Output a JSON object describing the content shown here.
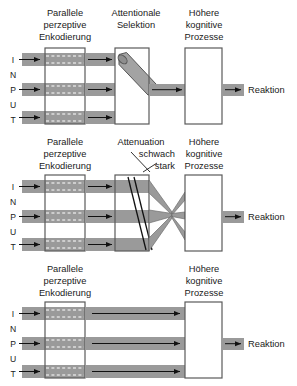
{
  "figure": {
    "colors": {
      "band": "#9a9a9a",
      "band_stroke": "#6e6e6e",
      "box_fill": "#ffffff",
      "box_stroke": "#5a5a5a",
      "arrow": "#111111",
      "text": "#1a1a1a",
      "dash": "#ffffff"
    }
  },
  "input_label": {
    "letters": [
      "I",
      "N",
      "P",
      "U",
      "T"
    ]
  },
  "panels": [
    {
      "id": "panel-early-selection",
      "headings": {
        "encoding": [
          "Parallele",
          "perzeptive",
          "Enkodierung"
        ],
        "selection": [
          "Attentionale",
          "Selektion"
        ],
        "cognitive": [
          "Höhere",
          "kognitive",
          "Prozesse"
        ]
      },
      "output_label": "Reaktion",
      "annotations": []
    },
    {
      "id": "panel-attenuation",
      "headings": {
        "encoding": [
          "Parallele",
          "perzeptive",
          "Enkodierung"
        ],
        "selection": [
          "Attenuation"
        ],
        "cognitive": [
          "Höhere",
          "kognitive",
          "Prozesse"
        ]
      },
      "output_label": "Reaktion",
      "annotations": [
        "schwach",
        "stark"
      ]
    },
    {
      "id": "panel-late-selection",
      "headings": {
        "encoding": [
          "Parallele",
          "perzeptive",
          "Enkodierung"
        ],
        "selection": [],
        "cognitive": [
          "Höhere",
          "kognitive",
          "Prozesse"
        ]
      },
      "output_label": "Reaktion",
      "annotations": []
    }
  ]
}
